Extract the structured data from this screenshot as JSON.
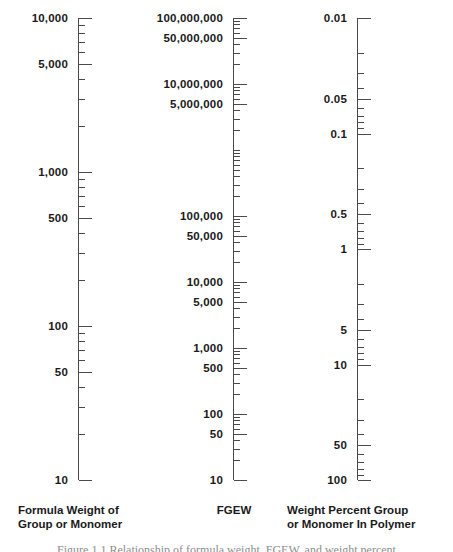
{
  "figure": {
    "caption": "Figure 1.1  Relationship of formula weight, FGEW, and weight percent"
  },
  "chart_data": {
    "type": "nomogram",
    "title": "",
    "axes": [
      {
        "id": "formula-weight",
        "caption_line1": "Formula Weight of",
        "caption_line2": "Group or Monomer",
        "scale": "log",
        "direction": "descending",
        "range": [
          10,
          10000
        ],
        "labels": [
          "10,000",
          "5,000",
          "1,000",
          "500",
          "100",
          "50",
          "10"
        ],
        "label_values": [
          10000,
          5000,
          1000,
          500,
          100,
          50,
          10
        ],
        "ticks": [
          10000,
          9000,
          8000,
          7000,
          6000,
          5000,
          4000,
          3000,
          2000,
          1000,
          900,
          800,
          700,
          600,
          500,
          400,
          300,
          200,
          100,
          90,
          80,
          70,
          60,
          50,
          40,
          30,
          20,
          10
        ]
      },
      {
        "id": "fgew",
        "caption_line1": "FGEW",
        "caption_line2": "",
        "scale": "log",
        "direction": "descending",
        "range": [
          10,
          100000000
        ],
        "labels": [
          "100,000,000",
          "50,000,000",
          "10,000,000",
          "5,000,000",
          "100,000",
          "50,000",
          "10,000",
          "5,000",
          "1,000",
          "500",
          "100",
          "50",
          "10"
        ],
        "label_values": [
          100000000,
          50000000,
          10000000,
          5000000,
          100000,
          50000,
          10000,
          5000,
          1000,
          500,
          100,
          50,
          10
        ],
        "ticks": [
          100000000,
          90000000,
          80000000,
          70000000,
          60000000,
          50000000,
          40000000,
          30000000,
          20000000,
          10000000,
          9000000,
          8000000,
          7000000,
          6000000,
          5000000,
          4000000,
          3000000,
          2000000,
          1000000,
          900000,
          800000,
          700000,
          600000,
          500000,
          400000,
          300000,
          200000,
          100000,
          90000,
          80000,
          70000,
          60000,
          50000,
          40000,
          30000,
          20000,
          10000,
          9000,
          8000,
          7000,
          6000,
          5000,
          4000,
          3000,
          2000,
          1000,
          900,
          800,
          700,
          600,
          500,
          400,
          300,
          200,
          100,
          90,
          80,
          70,
          60,
          50,
          40,
          30,
          20,
          10
        ]
      },
      {
        "id": "weight-percent",
        "caption_line1": "Weight Percent Group",
        "caption_line2": "or Monomer In Polymer",
        "scale": "log",
        "direction": "ascending",
        "range": [
          0.01,
          100
        ],
        "labels": [
          "0.01",
          "0.05",
          "0.1",
          "0.5",
          "1",
          "5",
          "10",
          "50",
          "100"
        ],
        "label_values": [
          0.01,
          0.05,
          0.1,
          0.5,
          1,
          5,
          10,
          50,
          100
        ],
        "ticks": [
          0.01,
          0.02,
          0.03,
          0.04,
          0.05,
          0.06,
          0.07,
          0.08,
          0.09,
          0.1,
          0.2,
          0.3,
          0.4,
          0.5,
          0.6,
          0.7,
          0.8,
          0.9,
          1,
          2,
          3,
          4,
          5,
          6,
          7,
          8,
          9,
          10,
          20,
          30,
          40,
          50,
          60,
          70,
          80,
          90,
          100
        ]
      }
    ],
    "colors": {
      "axis": "#4a4a4a",
      "text": "#1a1a1a",
      "background": "#ffffff"
    }
  }
}
